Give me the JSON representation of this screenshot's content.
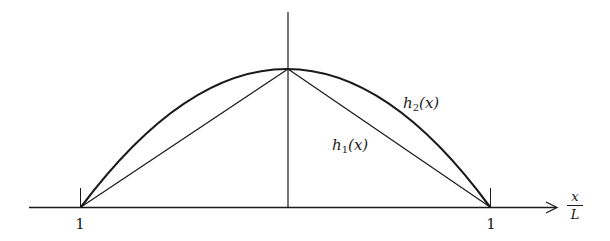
{
  "figure": {
    "axis": {
      "x_label_numerator": "x",
      "x_label_denominator": "L",
      "left_tick_label": "1",
      "right_tick_label": "1"
    },
    "curves": [
      {
        "id": "h1",
        "label_base": "h",
        "label_sub": "1",
        "label_arg": "(x)",
        "shape": "triangle (piecewise linear)"
      },
      {
        "id": "h2",
        "label_base": "h",
        "label_sub": "2",
        "label_arg": "(x)",
        "shape": "parabola"
      }
    ],
    "colors": {
      "stroke": "#1a1a1a",
      "background": "#ffffff"
    }
  }
}
